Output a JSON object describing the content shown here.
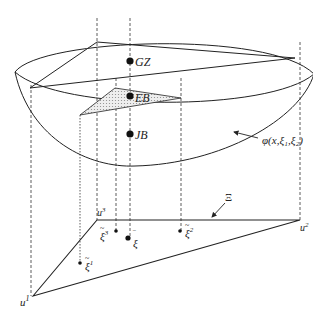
{
  "diagram": {
    "points_on_surface": [
      {
        "id": "gz",
        "label": "GZ"
      },
      {
        "id": "eb",
        "label": "EB"
      },
      {
        "id": "jb",
        "label": "JB"
      }
    ],
    "function_label": "φ(x,ξ₁,ξ₂)",
    "domain_label": "Ξ",
    "vertices": {
      "u1": {
        "base": "u",
        "sup": "1"
      },
      "u2": {
        "base": "u",
        "sup": "2"
      },
      "u3": {
        "base": "u",
        "sup": "3"
      }
    },
    "scenario_points": {
      "xi1": {
        "base": "ξ",
        "sup": "1",
        "accent": "~"
      },
      "xi2": {
        "base": "ξ",
        "sup": "2",
        "accent": "~"
      },
      "xi3": {
        "base": "ξ",
        "sup": "3",
        "accent": "~"
      },
      "xibar": {
        "base": "ξ",
        "accent": "‾"
      }
    },
    "colors": {
      "stroke": "#222222",
      "shade": "#d8d8d8"
    }
  }
}
